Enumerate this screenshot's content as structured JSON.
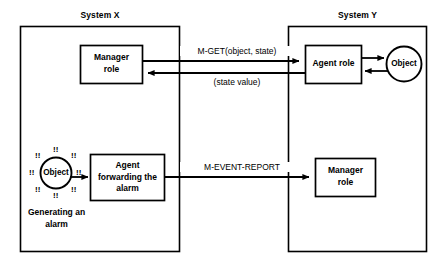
{
  "diagram": {
    "title_x": "System X",
    "title_y": "System Y",
    "systems": [
      {
        "id": "system-x",
        "label": "System X"
      },
      {
        "id": "system-y",
        "label": "System Y"
      }
    ],
    "nodes": {
      "manager_role_x": "Manager\nrole",
      "agent_role_y": "Agent role",
      "object_y": "Object",
      "object_alarm_x": "Object",
      "agent_forwarding_x": "Agent\nforwarding the\nalarm",
      "manager_role_y": "Manager\nrole"
    },
    "edges": {
      "m_get": "M-GET(object, state)",
      "state_value": "(state value)",
      "m_event_report": "M-EVENT-REPORT"
    },
    "captions": {
      "generating_alarm": "Generating an\nalarm"
    },
    "alarm_marks": [
      "!!",
      "!!",
      "!!",
      "!!",
      "!!",
      "!!",
      "!!",
      "!!"
    ],
    "colors": {
      "stroke": "#000000",
      "background": "#ffffff",
      "text": "#000000"
    }
  }
}
